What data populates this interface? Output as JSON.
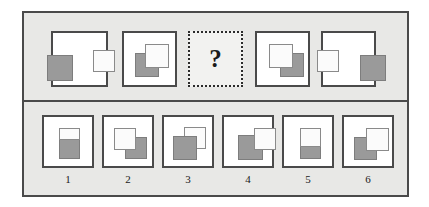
{
  "puzzle": {
    "type": "non-verbal-reasoning-matrix",
    "question_mark": "?",
    "colors": {
      "frame_background": "#e8e8e6",
      "frame_border": "#4a4a4a",
      "cell_background": "#ffffff",
      "shape_gray": "#9a9a9a",
      "shape_white": "#fbfbfb",
      "shape_outline": "#8a8a8a",
      "text": "#1a1a1a"
    },
    "question_row": {
      "cells": [
        {
          "position": 1,
          "is_question": false,
          "shapes": [
            {
              "fill": "gray",
              "left": -6,
              "top": 22,
              "width": 26,
              "height": 26,
              "z": 1
            },
            {
              "fill": "white",
              "left": 40,
              "top": 17,
              "width": 22,
              "height": 22,
              "z": 2
            }
          ]
        },
        {
          "position": 2,
          "is_question": false,
          "shapes": [
            {
              "fill": "gray",
              "left": 11,
              "top": 20,
              "width": 24,
              "height": 24,
              "z": 1
            },
            {
              "fill": "white",
              "left": 21,
              "top": 11,
              "width": 24,
              "height": 24,
              "z": 2
            }
          ]
        },
        {
          "position": 3,
          "is_question": true,
          "shapes": []
        },
        {
          "position": 4,
          "is_question": false,
          "shapes": [
            {
              "fill": "gray",
              "left": 23,
              "top": 20,
              "width": 24,
              "height": 24,
              "z": 1
            },
            {
              "fill": "white",
              "left": 12,
              "top": 11,
              "width": 24,
              "height": 24,
              "z": 2
            }
          ]
        },
        {
          "position": 5,
          "is_question": false,
          "shapes": [
            {
              "fill": "white",
              "left": -6,
              "top": 17,
              "width": 22,
              "height": 22,
              "z": 2
            },
            {
              "fill": "gray",
              "left": 37,
              "top": 22,
              "width": 26,
              "height": 26,
              "z": 1
            }
          ]
        }
      ]
    },
    "answer_row": {
      "options": [
        {
          "label": "1",
          "shapes": [
            {
              "fill": "gray",
              "left": 15,
              "top": 18,
              "width": 21,
              "height": 24,
              "z": 1
            },
            {
              "fill": "white",
              "left": 15,
              "top": 11,
              "width": 21,
              "height": 12,
              "z": 2
            }
          ]
        },
        {
          "label": "2",
          "shapes": [
            {
              "fill": "gray",
              "left": 21,
              "top": 20,
              "width": 22,
              "height": 22,
              "z": 1
            },
            {
              "fill": "white",
              "left": 10,
              "top": 11,
              "width": 22,
              "height": 22,
              "z": 2
            }
          ]
        },
        {
          "label": "3",
          "shapes": [
            {
              "fill": "white",
              "left": 20,
              "top": 10,
              "width": 22,
              "height": 22,
              "z": 1
            },
            {
              "fill": "gray",
              "left": 9,
              "top": 19,
              "width": 24,
              "height": 24,
              "z": 2
            }
          ]
        },
        {
          "label": "4",
          "shapes": [
            {
              "fill": "gray",
              "left": 14,
              "top": 18,
              "width": 25,
              "height": 25,
              "z": 1
            },
            {
              "fill": "white",
              "left": 30,
              "top": 11,
              "width": 22,
              "height": 22,
              "z": 2
            }
          ]
        },
        {
          "label": "5",
          "shapes": [
            {
              "fill": "gray",
              "left": 16,
              "top": 27,
              "width": 21,
              "height": 15,
              "z": 1
            },
            {
              "fill": "white",
              "left": 16,
              "top": 11,
              "width": 21,
              "height": 19,
              "z": 2
            }
          ]
        },
        {
          "label": "6",
          "shapes": [
            {
              "fill": "gray",
              "left": 10,
              "top": 20,
              "width": 23,
              "height": 23,
              "z": 1
            },
            {
              "fill": "white",
              "left": 22,
              "top": 11,
              "width": 23,
              "height": 23,
              "z": 2
            }
          ]
        }
      ]
    },
    "layout": {
      "question_cells": [
        {
          "left": 51,
          "top": 31,
          "width": 57,
          "height": 56
        },
        {
          "left": 122,
          "top": 31,
          "width": 55,
          "height": 56
        },
        {
          "left": 188,
          "top": 31,
          "width": 55,
          "height": 56
        },
        {
          "left": 255,
          "top": 31,
          "width": 55,
          "height": 56
        },
        {
          "left": 321,
          "top": 31,
          "width": 55,
          "height": 56
        }
      ],
      "option_cells": [
        {
          "left": 42,
          "top": 115,
          "width": 52,
          "height": 53
        },
        {
          "left": 102,
          "top": 115,
          "width": 52,
          "height": 53
        },
        {
          "left": 162,
          "top": 115,
          "width": 52,
          "height": 53
        },
        {
          "left": 222,
          "top": 115,
          "width": 52,
          "height": 53
        },
        {
          "left": 282,
          "top": 115,
          "width": 52,
          "height": 53
        },
        {
          "left": 342,
          "top": 115,
          "width": 52,
          "height": 53
        }
      ],
      "option_label_top": 173
    }
  }
}
